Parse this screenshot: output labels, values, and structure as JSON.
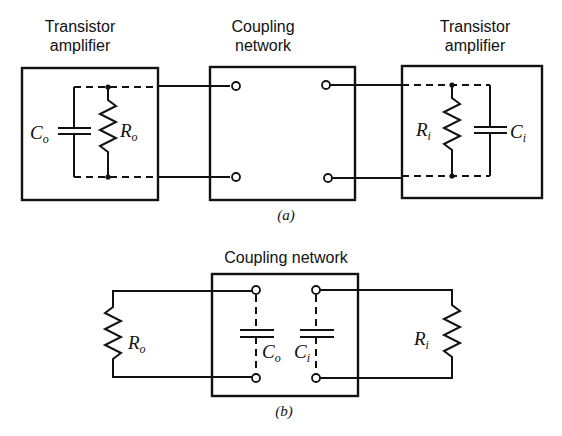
{
  "figure_a": {
    "caption": "(a)",
    "left_block": {
      "title_line1": "Transistor",
      "title_line2": "amplifier",
      "capacitor": {
        "main": "C",
        "sub": "o"
      },
      "resistor": {
        "main": "R",
        "sub": "o"
      }
    },
    "middle_block": {
      "title_line1": "Coupling",
      "title_line2": "network"
    },
    "right_block": {
      "title_line1": "Transistor",
      "title_line2": "amplifier",
      "resistor": {
        "main": "R",
        "sub": "i"
      },
      "capacitor": {
        "main": "C",
        "sub": "i"
      }
    }
  },
  "figure_b": {
    "caption": "(b)",
    "title": "Coupling network",
    "left_resistor": {
      "main": "R",
      "sub": "o"
    },
    "cap_o": {
      "main": "C",
      "sub": "o"
    },
    "cap_i": {
      "main": "C",
      "sub": "i"
    },
    "right_resistor": {
      "main": "R",
      "sub": "i"
    }
  }
}
